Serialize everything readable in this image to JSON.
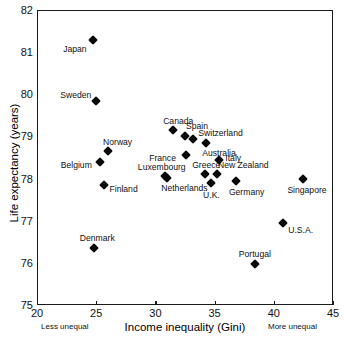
{
  "chart_data": {
    "type": "scatter",
    "title": "",
    "xlabel": "Income inequality (Gini)",
    "ylabel": "Life expectancy (years)",
    "xlim": [
      20,
      45
    ],
    "ylim": [
      75,
      82
    ],
    "xticks": [
      20,
      25,
      30,
      35,
      40,
      45
    ],
    "yticks": [
      75,
      76,
      77,
      78,
      79,
      80,
      81,
      82
    ],
    "grid": false,
    "legend": null,
    "x_axis_left_note": "Less unequal",
    "x_axis_right_note": "More unequal",
    "points": [
      {
        "label": "Japan",
        "x": 24.75,
        "y": 81.3,
        "label_dx": -30,
        "label_dy": 9
      },
      {
        "label": "Sweden",
        "x": 25.0,
        "y": 79.85,
        "label_dx": -36,
        "label_dy": -6
      },
      {
        "label": "Canada",
        "x": 31.5,
        "y": 79.15,
        "label_dx": -10,
        "label_dy": -9
      },
      {
        "label": "Spain",
        "x": 32.5,
        "y": 79.0,
        "label_dx": 1,
        "label_dy": -10
      },
      {
        "label": "Switzerland",
        "x": 33.2,
        "y": 78.95,
        "label_dx": 5,
        "label_dy": -6
      },
      {
        "label": "Norway",
        "x": 26.0,
        "y": 78.65,
        "label_dx": -5,
        "label_dy": -9
      },
      {
        "label": "Australia",
        "x": 34.3,
        "y": 78.85,
        "label_dx": -4,
        "label_dy": 10
      },
      {
        "label": "Belgium",
        "x": 25.3,
        "y": 78.4,
        "label_dx": -39,
        "label_dy": 3
      },
      {
        "label": "France",
        "x": 32.6,
        "y": 78.55,
        "label_dx": -37,
        "label_dy": 3
      },
      {
        "label": "Italy",
        "x": 35.4,
        "y": 78.45,
        "label_dx": 6,
        "label_dy": -2
      },
      {
        "label": "Luxembourg",
        "x": 30.8,
        "y": 78.05,
        "label_dx": -27,
        "label_dy": -9
      },
      {
        "label": "Greece",
        "x": 34.2,
        "y": 78.12,
        "label_dx": -13,
        "label_dy": -9
      },
      {
        "label": "New Zealand",
        "x": 35.2,
        "y": 78.1,
        "label_dx": 1,
        "label_dy": -9
      },
      {
        "label": "Netherlands",
        "x": 31.0,
        "y": 78.02,
        "label_dx": -6,
        "label_dy": 10
      },
      {
        "label": "U.K.",
        "x": 34.7,
        "y": 77.9,
        "label_dx": -8,
        "label_dy": 12
      },
      {
        "label": "Germany",
        "x": 36.8,
        "y": 77.95,
        "label_dx": -7,
        "label_dy": 11
      },
      {
        "label": "Singapore",
        "x": 42.5,
        "y": 78.0,
        "label_dx": -16,
        "label_dy": 11
      },
      {
        "label": "Finland",
        "x": 25.7,
        "y": 77.85,
        "label_dx": 5,
        "label_dy": 4
      },
      {
        "label": "U.S.A.",
        "x": 40.8,
        "y": 76.95,
        "label_dx": 5,
        "label_dy": 7
      },
      {
        "label": "Denmark",
        "x": 24.8,
        "y": 76.35,
        "label_dx": -14,
        "label_dy": -10
      },
      {
        "label": "Portugal",
        "x": 38.4,
        "y": 75.98,
        "label_dx": -16,
        "label_dy": -10
      }
    ]
  }
}
